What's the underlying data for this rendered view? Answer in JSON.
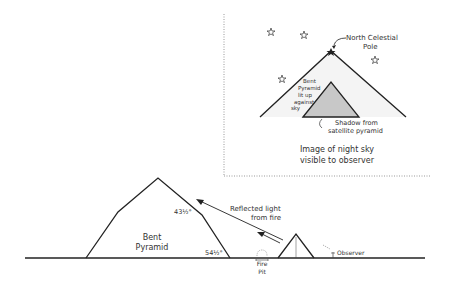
{
  "inset": {
    "north_pole_label_1": "North Celestial",
    "north_pole_label_2": "Pole",
    "bent_lit_1": "Bent",
    "bent_lit_2": "Pyramid",
    "bent_lit_3": "lit up",
    "bent_lit_4": "against",
    "bent_lit_5": "sky",
    "shadow_label_1": "Shadow from",
    "shadow_label_2": "satellite pyramid",
    "caption_1": "Image of night sky",
    "caption_2": "visible to observer"
  },
  "ground": {
    "bent_label_1": "Bent",
    "bent_label_2": "Pyramid",
    "upper_angle": "43½°",
    "lower_angle": "54½°",
    "reflected_1": "Reflected light",
    "reflected_2": "from fire",
    "fire_1": "Fire",
    "fire_2": "Pit",
    "observer": "Observer"
  },
  "colors": {
    "line": "#222222",
    "shadow_fill": "#c8c8c8",
    "sky_fill": "#f4f4f4",
    "frame": "#999999"
  }
}
